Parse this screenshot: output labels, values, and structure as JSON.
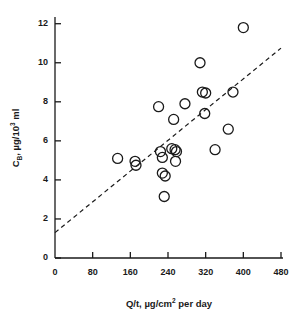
{
  "chart_data": {
    "type": "scatter",
    "title": "",
    "xlabel": "Q/t, µg/cm² per day",
    "ylabel": "Cʙ, µg/10³ ml",
    "xlabel_parts": {
      "pre": "Q/t, µg/cm",
      "sup": "2",
      "post": " per day"
    },
    "ylabel_parts": {
      "pre": "C",
      "sub": "B",
      "mid": ", µg/10",
      "sup": "3",
      "post": " ml"
    },
    "xlim": [
      0,
      480
    ],
    "ylim": [
      0,
      12.6
    ],
    "xticks": [
      0,
      80,
      160,
      240,
      320,
      400,
      480
    ],
    "yticks": [
      0,
      2,
      4,
      6,
      8,
      10,
      12
    ],
    "xtick_labels": [
      "0",
      "80",
      "160",
      "240",
      "320",
      "400",
      "480"
    ],
    "ytick_labels": [
      "0",
      "2",
      "4",
      "6",
      "8",
      "10",
      "12"
    ],
    "grid": false,
    "legend": false,
    "marker": "open-circle",
    "marker_color": "#1a1a1a",
    "points": [
      {
        "x": 133,
        "y": 5.1
      },
      {
        "x": 170,
        "y": 4.95
      },
      {
        "x": 172,
        "y": 4.75
      },
      {
        "x": 220,
        "y": 7.75
      },
      {
        "x": 224,
        "y": 5.45
      },
      {
        "x": 228,
        "y": 5.15
      },
      {
        "x": 228,
        "y": 4.35
      },
      {
        "x": 234,
        "y": 4.2
      },
      {
        "x": 232,
        "y": 3.15
      },
      {
        "x": 252,
        "y": 7.1
      },
      {
        "x": 248,
        "y": 5.6
      },
      {
        "x": 255,
        "y": 5.55
      },
      {
        "x": 258,
        "y": 5.45
      },
      {
        "x": 256,
        "y": 4.95
      },
      {
        "x": 276,
        "y": 7.9
      },
      {
        "x": 308,
        "y": 10.0
      },
      {
        "x": 313,
        "y": 8.5
      },
      {
        "x": 320,
        "y": 8.45
      },
      {
        "x": 318,
        "y": 7.4
      },
      {
        "x": 340,
        "y": 5.55
      },
      {
        "x": 368,
        "y": 6.6
      },
      {
        "x": 378,
        "y": 8.5
      },
      {
        "x": 400,
        "y": 11.8
      }
    ],
    "trendline": {
      "style": "dashed",
      "x0": 0,
      "y0": 1.3,
      "x1": 480,
      "y1": 10.75
    }
  }
}
